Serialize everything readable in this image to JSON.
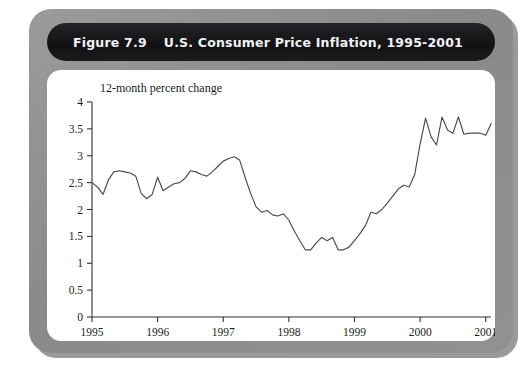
{
  "figure": {
    "number_label": "Figure 7.9",
    "title": "U.S. Consumer Price Inflation, 1995-2001"
  },
  "chart_data": {
    "type": "line",
    "title": "U.S. Consumer Price Inflation, 1995-2001",
    "subtitle": "",
    "ylabel": "12-month percent change",
    "xlabel": "",
    "ylim": [
      0,
      4
    ],
    "xlim": [
      1995,
      2001.08
    ],
    "yticks": [
      0,
      0.5,
      1,
      1.5,
      2,
      2.5,
      3,
      3.5,
      4
    ],
    "ytick_labels": [
      "0",
      "0.5",
      "1",
      "1.5",
      "2",
      "2.5",
      "3",
      "3.5",
      "4"
    ],
    "xticks": [
      1995,
      1996,
      1997,
      1998,
      1999,
      2000,
      2001
    ],
    "xtick_labels": [
      "1995",
      "1996",
      "1997",
      "1998",
      "1999",
      "2000",
      "2001"
    ],
    "grid": false,
    "legend": false,
    "series": [
      {
        "name": "12-month percent change in CPI",
        "x": [
          1995.0,
          1995.083,
          1995.167,
          1995.25,
          1995.333,
          1995.417,
          1995.5,
          1995.583,
          1995.667,
          1995.75,
          1995.833,
          1995.917,
          1996.0,
          1996.083,
          1996.167,
          1996.25,
          1996.333,
          1996.417,
          1996.5,
          1996.583,
          1996.667,
          1996.75,
          1996.833,
          1996.917,
          1997.0,
          1997.083,
          1997.167,
          1997.25,
          1997.333,
          1997.417,
          1997.5,
          1997.583,
          1997.667,
          1997.75,
          1997.833,
          1997.917,
          1998.0,
          1998.083,
          1998.167,
          1998.25,
          1998.333,
          1998.417,
          1998.5,
          1998.583,
          1998.667,
          1998.75,
          1998.833,
          1998.917,
          1999.0,
          1999.083,
          1999.167,
          1999.25,
          1999.333,
          1999.417,
          1999.5,
          1999.583,
          1999.667,
          1999.75,
          1999.833,
          1999.917,
          2000.0,
          2000.083,
          2000.167,
          2000.25,
          2000.333,
          2000.417,
          2000.5,
          2000.583,
          2000.667,
          2000.75,
          2000.833,
          2000.917,
          2001.0,
          2001.083
        ],
        "values": [
          2.5,
          2.42,
          2.28,
          2.55,
          2.7,
          2.72,
          2.7,
          2.68,
          2.62,
          2.3,
          2.2,
          2.28,
          2.6,
          2.35,
          2.42,
          2.48,
          2.5,
          2.58,
          2.72,
          2.7,
          2.65,
          2.62,
          2.7,
          2.8,
          2.9,
          2.95,
          2.98,
          2.92,
          2.6,
          2.3,
          2.05,
          1.95,
          1.98,
          1.9,
          1.88,
          1.92,
          1.8,
          1.6,
          1.42,
          1.25,
          1.25,
          1.38,
          1.48,
          1.42,
          1.48,
          1.25,
          1.25,
          1.3,
          1.42,
          1.55,
          1.7,
          1.95,
          1.92,
          2.0,
          2.12,
          2.25,
          2.38,
          2.45,
          2.42,
          2.65,
          3.22,
          3.7,
          3.35,
          3.2,
          3.72,
          3.48,
          3.42,
          3.72,
          3.4,
          3.42,
          3.42,
          3.42,
          3.38,
          3.6
        ]
      }
    ]
  }
}
